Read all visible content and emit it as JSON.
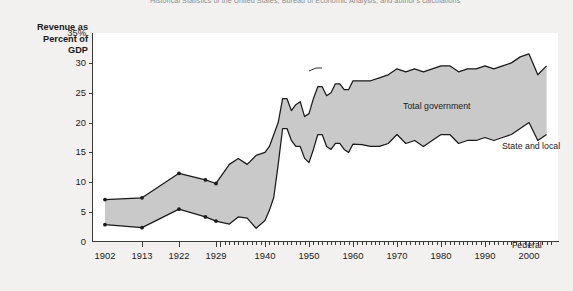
{
  "source_note": "Historical Statistics of the United States, Bureau of Economic Analysis, and author's calculations",
  "figure_mark": "",
  "axis": {
    "y_caption_line1": "Revenue as",
    "y_caption_line2": "Percent of",
    "y_caption_line3": "GDP",
    "y_ticks": [
      "35%",
      "30",
      "25",
      "20",
      "15",
      "10",
      "5",
      "0"
    ],
    "x_ticks": [
      "1902",
      "1913",
      "1922",
      "1929",
      "1940",
      "1950",
      "1960",
      "1970",
      "1980",
      "1990",
      "2000"
    ]
  },
  "annotations": {
    "total": "Total government",
    "state_local": "State and local",
    "federal": "Federal"
  },
  "colors": {
    "band_fill": "#c9c9c9",
    "line": "#1a1a1a",
    "plot_bg": "#ffffff",
    "page_bg": "#f2f1ef"
  },
  "chart_data": {
    "type": "area",
    "title": "",
    "xlabel": "",
    "ylabel": "Revenue as Percent of GDP",
    "ylim": [
      0,
      35
    ],
    "xlim": [
      1902,
      2005
    ],
    "grid": false,
    "legend": "in-plot annotations",
    "series": [
      {
        "name": "Federal",
        "x": [
          1902,
          1913,
          1922,
          1927,
          1929,
          1932,
          1934,
          1936,
          1938,
          1940,
          1941,
          1942,
          1943,
          1944,
          1945,
          1946,
          1947,
          1948,
          1949,
          1950,
          1951,
          1952,
          1953,
          1954,
          1955,
          1956,
          1957,
          1958,
          1959,
          1960,
          1962,
          1964,
          1966,
          1968,
          1970,
          1972,
          1974,
          1976,
          1978,
          1980,
          1982,
          1984,
          1986,
          1988,
          1990,
          1992,
          1994,
          1996,
          1998,
          2000,
          2002,
          2004
        ],
        "values": [
          2.9,
          2.4,
          5.5,
          4.2,
          3.5,
          3.0,
          4.2,
          4.0,
          2.3,
          3.6,
          5.3,
          7.5,
          13.0,
          19.0,
          19.0,
          17.0,
          16.0,
          16.0,
          14.0,
          13.3,
          15.5,
          18.0,
          18.0,
          16.0,
          15.5,
          16.5,
          16.5,
          15.5,
          15.0,
          16.4,
          16.3,
          16.0,
          16.0,
          16.5,
          18.0,
          16.5,
          17.0,
          16.0,
          17.0,
          18.0,
          18.0,
          16.5,
          17.0,
          17.0,
          17.5,
          17.0,
          17.5,
          18.0,
          19.0,
          20.0,
          17.0,
          18.0
        ]
      },
      {
        "name": "Total government",
        "x": [
          1902,
          1913,
          1922,
          1927,
          1929,
          1932,
          1934,
          1936,
          1938,
          1940,
          1941,
          1942,
          1943,
          1944,
          1945,
          1946,
          1947,
          1948,
          1949,
          1950,
          1951,
          1952,
          1953,
          1954,
          1955,
          1956,
          1957,
          1958,
          1959,
          1960,
          1962,
          1964,
          1966,
          1968,
          1970,
          1972,
          1974,
          1976,
          1978,
          1980,
          1982,
          1984,
          1986,
          1988,
          1990,
          1992,
          1994,
          1996,
          1998,
          2000,
          2002,
          2004
        ],
        "values": [
          7.1,
          7.4,
          11.5,
          10.4,
          9.8,
          13.0,
          14.0,
          13.0,
          14.5,
          15.0,
          16.0,
          18.0,
          20.0,
          24.0,
          24.0,
          22.0,
          23.0,
          23.5,
          21.0,
          21.5,
          24.0,
          26.0,
          26.0,
          24.5,
          25.0,
          26.5,
          26.5,
          25.5,
          25.5,
          27.0,
          27.0,
          27.0,
          27.5,
          28.0,
          29.0,
          28.5,
          29.0,
          28.5,
          29.0,
          29.5,
          29.5,
          28.5,
          29.0,
          29.0,
          29.5,
          29.0,
          29.5,
          30.0,
          31.0,
          31.5,
          28.0,
          29.5
        ]
      }
    ]
  }
}
